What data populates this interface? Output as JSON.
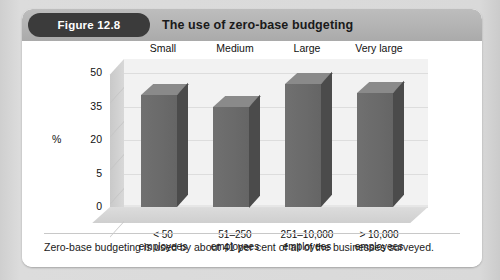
{
  "figure": {
    "badge_label": "Figure 12.8",
    "title": "The use of zero-base budgeting",
    "caption": "Zero-base budgeting is used by about 41 per cent of all of the businesses surveyed."
  },
  "chart_data": {
    "type": "bar",
    "title": "The use of zero-base budgeting",
    "xlabel": "",
    "ylabel": "%",
    "ylim": [
      0,
      50
    ],
    "grid": true,
    "legend": "none",
    "three_d": true,
    "ytick_labels": [
      "50",
      "35",
      "20",
      "5",
      "0"
    ],
    "ytick_values": [
      50,
      35,
      20,
      5,
      0
    ],
    "categories": [
      "Small",
      "Medium",
      "Large",
      "Very large"
    ],
    "category_sublabels": [
      "< 50\nemployees",
      "51–250\nemployees",
      "251–10,000\nemployees",
      "> 10,000\nemployees"
    ],
    "category_sublabel_line1": [
      "< 50",
      "51–250",
      "251–10,000",
      "> 10,000"
    ],
    "category_sublabel_line2": [
      "employees",
      "employees",
      "employees",
      "employees"
    ],
    "values": [
      40,
      35,
      45,
      41
    ]
  },
  "colors": {
    "page_background": "#d6d6d6",
    "card_background": "#ffffff",
    "header_band": "#b3b3b3",
    "badge_background": "#3b3b3b",
    "badge_text": "#ffffff",
    "title_text": "#1a1a1a",
    "bar_front": "#6a6a6a",
    "bar_side": "#4b4b4b",
    "bar_top": "#8a8a8a",
    "plot_background": "#f2f2f2",
    "floor": "#d4d4d4",
    "gridline": "#dddddd"
  }
}
